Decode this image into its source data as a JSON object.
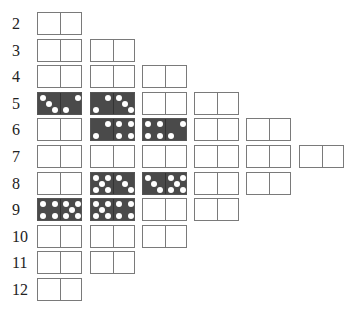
{
  "layout": {
    "col_x": [
      37,
      90,
      142,
      194,
      246,
      299
    ],
    "row_y_start": 12,
    "row_pitch": 26.6
  },
  "rows": [
    {
      "label": "2",
      "dominoes": [
        null
      ]
    },
    {
      "label": "3",
      "dominoes": [
        null,
        null
      ]
    },
    {
      "label": "4",
      "dominoes": [
        null,
        null,
        null
      ]
    },
    {
      "label": "5",
      "dominoes": [
        [
          3,
          2
        ],
        [
          2,
          3
        ],
        null,
        null
      ]
    },
    {
      "label": "6",
      "dominoes": [
        null,
        [
          2,
          4
        ],
        [
          4,
          2
        ],
        null,
        null
      ]
    },
    {
      "label": "7",
      "dominoes": [
        null,
        null,
        null,
        null,
        null,
        null
      ]
    },
    {
      "label": "8",
      "dominoes": [
        null,
        [
          5,
          3
        ],
        [
          3,
          5
        ],
        null,
        null
      ]
    },
    {
      "label": "9",
      "dominoes": [
        [
          4,
          5
        ],
        [
          5,
          4
        ],
        null,
        null
      ]
    },
    {
      "label": "10",
      "dominoes": [
        null,
        null,
        null
      ]
    },
    {
      "label": "11",
      "dominoes": [
        null,
        null
      ]
    },
    {
      "label": "12",
      "dominoes": [
        null
      ]
    }
  ],
  "colors": {
    "filled": "#4a4a4a",
    "border": "#7a7a7a",
    "pip": "#ffffff",
    "label": "#222222"
  }
}
